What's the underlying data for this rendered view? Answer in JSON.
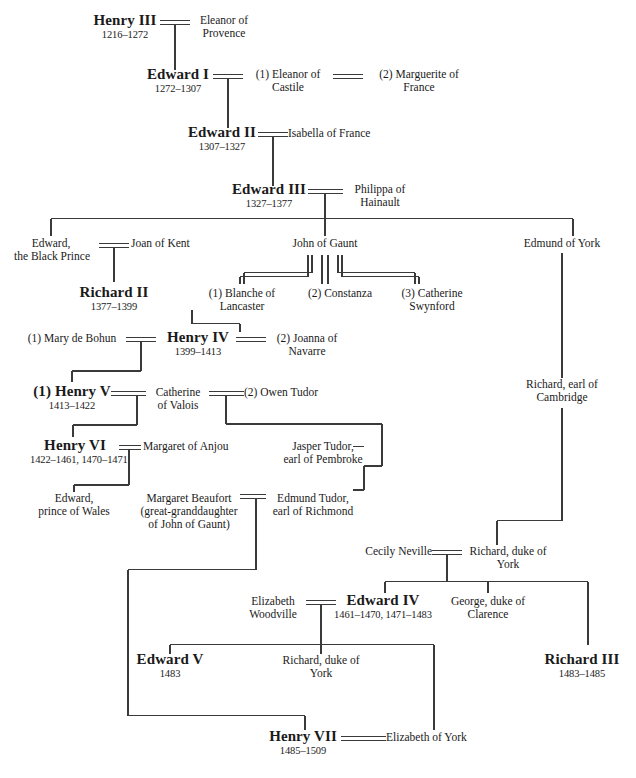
{
  "diagram": {
    "line_color": "#3a3a3a",
    "text_color": "#1a1a1a",
    "background": "#ffffff"
  },
  "people": {
    "henry3": {
      "name": "Henry III",
      "dates": "1216–1272"
    },
    "eleanor_prov": {
      "name": "Eleanor of\nProvence",
      "line1": "Eleanor of",
      "line2": "Provence"
    },
    "edward1": {
      "name": "Edward I",
      "dates": "1272–1307"
    },
    "eleanor_cast": {
      "line1": "(1) Eleanor of",
      "line2": "Castile"
    },
    "marguerite": {
      "line1": "(2) Marguerite of",
      "line2": "France"
    },
    "edward2": {
      "name": "Edward II",
      "dates": "1307–1327"
    },
    "isabella": {
      "line1": "Isabella of France",
      "line2": ""
    },
    "edward3": {
      "name": "Edward III",
      "dates": "1327–1377"
    },
    "philippa": {
      "line1": "Philippa of",
      "line2": "Hainault"
    },
    "black_prince": {
      "line1": "Edward,",
      "line2": "the Black Prince"
    },
    "joan_kent": {
      "line1": "Joan of Kent",
      "line2": ""
    },
    "richard2": {
      "name": "Richard II",
      "dates": "1377–1399"
    },
    "john_gaunt": {
      "line1": "John of Gaunt",
      "line2": ""
    },
    "blanche": {
      "line1": "(1) Blanche of",
      "line2": "Lancaster"
    },
    "constanza": {
      "line1": "(2) Constanza",
      "line2": ""
    },
    "catherine_sw": {
      "line1": "(3) Catherine",
      "line2": "Swynford"
    },
    "edmund_york": {
      "line1": "Edmund of York",
      "line2": ""
    },
    "mary_bohun": {
      "line1": "(1) Mary de Bohun",
      "line2": ""
    },
    "henry4": {
      "name": "Henry IV",
      "dates": "1399–1413"
    },
    "joanna_nav": {
      "line1": "(2) Joanna of",
      "line2": "Navarre"
    },
    "richard_camb": {
      "line1": "Richard, earl of",
      "line2": "Cambridge"
    },
    "henry5": {
      "name": "(1) Henry V",
      "dates": "1413–1422"
    },
    "catherine_val": {
      "line1": "Catherine",
      "line2": "of Valois"
    },
    "owen_tudor": {
      "line1": "(2) Owen Tudor",
      "line2": ""
    },
    "henry6": {
      "name": "Henry VI",
      "dates": "1422–1461, 1470–1471"
    },
    "margaret_anjou": {
      "line1": "Margaret of Anjou",
      "line2": ""
    },
    "jasper_tudor": {
      "line1": "Jasper Tudor,",
      "line2": "earl of Pembroke"
    },
    "edward_wales": {
      "line1": "Edward,",
      "line2": "prince of Wales"
    },
    "margaret_beaufort": {
      "line1": "Margaret Beaufort",
      "line2": "(great-granddaughter",
      "line3": "of John of Gaunt)"
    },
    "edmund_tudor": {
      "line1": "Edmund Tudor,",
      "line2": "earl of Richmond"
    },
    "cecily": {
      "line1": "Cecily Neville",
      "line2": ""
    },
    "richard_york": {
      "line1": "Richard, duke of",
      "line2": "York"
    },
    "elizabeth_wood": {
      "line1": "Elizabeth",
      "line2": "Woodville"
    },
    "edward4": {
      "name": "Edward IV",
      "dates": "1461–1470, 1471–1483"
    },
    "george_clarence": {
      "line1": "George, duke of",
      "line2": "Clarence"
    },
    "edward5": {
      "name": "Edward V",
      "dates": "1483"
    },
    "richard_york2": {
      "line1": "Richard, duke of",
      "line2": "York"
    },
    "richard3": {
      "name": "Richard III",
      "dates": "1483–1485"
    },
    "henry7": {
      "name": "Henry VII",
      "dates": "1485–1509"
    },
    "elizabeth_york": {
      "line1": "Elizabeth of York",
      "line2": ""
    }
  }
}
